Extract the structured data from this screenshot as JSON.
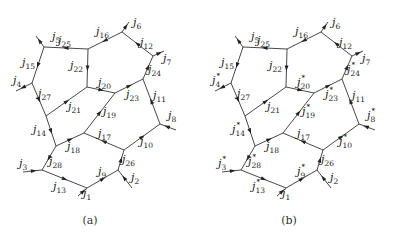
{
  "panels": [
    {
      "id": "a",
      "caption": "(a)",
      "offset_x": 0,
      "labels": [
        {
          "name": "j",
          "sub": "5",
          "star": false,
          "x": 52,
          "y": 40
        },
        {
          "name": "j",
          "sub": "25",
          "star": false,
          "x": 58,
          "y": 44
        },
        {
          "name": "j",
          "sub": "16",
          "star": false,
          "x": 96,
          "y": 35
        },
        {
          "name": "j",
          "sub": "6",
          "star": false,
          "x": 133,
          "y": 26
        },
        {
          "name": "j",
          "sub": "12",
          "star": false,
          "x": 140,
          "y": 46
        },
        {
          "name": "j",
          "sub": "7",
          "star": false,
          "x": 163,
          "y": 62
        },
        {
          "name": "j",
          "sub": "24",
          "star": false,
          "x": 148,
          "y": 73
        },
        {
          "name": "j",
          "sub": "22",
          "star": false,
          "x": 70,
          "y": 69
        },
        {
          "name": "j",
          "sub": "15",
          "star": false,
          "x": 22,
          "y": 66
        },
        {
          "name": "j",
          "sub": "4",
          "star": false,
          "x": 13,
          "y": 84
        },
        {
          "name": "j",
          "sub": "27",
          "star": false,
          "x": 38,
          "y": 97
        },
        {
          "name": "j",
          "sub": "20",
          "star": false,
          "x": 98,
          "y": 86
        },
        {
          "name": "j",
          "sub": "23",
          "star": false,
          "x": 126,
          "y": 98
        },
        {
          "name": "j",
          "sub": "11",
          "star": false,
          "x": 153,
          "y": 99
        },
        {
          "name": "j",
          "sub": "21",
          "star": false,
          "x": 68,
          "y": 110
        },
        {
          "name": "j",
          "sub": "19",
          "star": false,
          "x": 103,
          "y": 115
        },
        {
          "name": "j",
          "sub": "8",
          "star": false,
          "x": 168,
          "y": 119
        },
        {
          "name": "j",
          "sub": "14",
          "star": false,
          "x": 33,
          "y": 133
        },
        {
          "name": "j",
          "sub": "17",
          "star": false,
          "x": 98,
          "y": 137
        },
        {
          "name": "j",
          "sub": "10",
          "star": false,
          "x": 140,
          "y": 145
        },
        {
          "name": "j",
          "sub": "18",
          "star": false,
          "x": 67,
          "y": 150
        },
        {
          "name": "j",
          "sub": "28",
          "star": false,
          "x": 49,
          "y": 165
        },
        {
          "name": "j",
          "sub": "26",
          "star": false,
          "x": 122,
          "y": 163
        },
        {
          "name": "j",
          "sub": "3",
          "star": false,
          "x": 19,
          "y": 167
        },
        {
          "name": "j",
          "sub": "9",
          "star": false,
          "x": 98,
          "y": 175
        },
        {
          "name": "j",
          "sub": "13",
          "star": false,
          "x": 53,
          "y": 190
        },
        {
          "name": "j",
          "sub": "2",
          "star": false,
          "x": 131,
          "y": 181
        },
        {
          "name": "j",
          "sub": "1",
          "star": false,
          "x": 83,
          "y": 197
        }
      ]
    },
    {
      "id": "b",
      "caption": "(b)",
      "offset_x": 199,
      "labels": [
        {
          "name": "j",
          "sub": "5",
          "star": false,
          "x": 52,
          "y": 40
        },
        {
          "name": "j",
          "sub": "25",
          "star": false,
          "x": 58,
          "y": 44
        },
        {
          "name": "j",
          "sub": "16",
          "star": false,
          "x": 96,
          "y": 35
        },
        {
          "name": "j",
          "sub": "6",
          "star": false,
          "x": 133,
          "y": 26
        },
        {
          "name": "j",
          "sub": "12",
          "star": false,
          "x": 140,
          "y": 46
        },
        {
          "name": "j",
          "sub": "7",
          "star": false,
          "x": 163,
          "y": 62
        },
        {
          "name": "j",
          "sub": "24",
          "star": true,
          "x": 148,
          "y": 73
        },
        {
          "name": "j",
          "sub": "22",
          "star": false,
          "x": 70,
          "y": 69
        },
        {
          "name": "j",
          "sub": "15",
          "star": false,
          "x": 22,
          "y": 66
        },
        {
          "name": "j",
          "sub": "4",
          "star": true,
          "x": 13,
          "y": 84
        },
        {
          "name": "j",
          "sub": "27",
          "star": false,
          "x": 38,
          "y": 97
        },
        {
          "name": "j",
          "sub": "20",
          "star": true,
          "x": 98,
          "y": 86
        },
        {
          "name": "j",
          "sub": "23",
          "star": true,
          "x": 126,
          "y": 98
        },
        {
          "name": "j",
          "sub": "11",
          "star": false,
          "x": 153,
          "y": 99
        },
        {
          "name": "j",
          "sub": "21",
          "star": false,
          "x": 68,
          "y": 110
        },
        {
          "name": "j",
          "sub": "19",
          "star": true,
          "x": 103,
          "y": 115
        },
        {
          "name": "j",
          "sub": "8",
          "star": true,
          "x": 168,
          "y": 119
        },
        {
          "name": "j",
          "sub": "14",
          "star": true,
          "x": 33,
          "y": 133
        },
        {
          "name": "j",
          "sub": "17",
          "star": false,
          "x": 98,
          "y": 137
        },
        {
          "name": "j",
          "sub": "10",
          "star": true,
          "x": 140,
          "y": 145
        },
        {
          "name": "j",
          "sub": "18",
          "star": false,
          "x": 67,
          "y": 150
        },
        {
          "name": "j",
          "sub": "28",
          "star": true,
          "x": 49,
          "y": 165
        },
        {
          "name": "j",
          "sub": "26",
          "star": false,
          "x": 122,
          "y": 163
        },
        {
          "name": "j",
          "sub": "3",
          "star": true,
          "x": 19,
          "y": 167
        },
        {
          "name": "j",
          "sub": "9",
          "star": true,
          "x": 98,
          "y": 175
        },
        {
          "name": "j",
          "sub": "13",
          "star": true,
          "x": 53,
          "y": 190
        },
        {
          "name": "j",
          "sub": "2",
          "star": false,
          "x": 131,
          "y": 181
        },
        {
          "name": "j",
          "sub": "1",
          "star": false,
          "x": 83,
          "y": 197
        }
      ]
    }
  ],
  "graph": {
    "nodes": {
      "A": [
        44,
        47
      ],
      "B": [
        88,
        49
      ],
      "C": [
        122,
        32
      ],
      "D": [
        153,
        56
      ],
      "E": [
        143,
        79
      ],
      "F": [
        115,
        93
      ],
      "G": [
        87,
        87
      ],
      "H": [
        32,
        83
      ],
      "I": [
        46,
        116
      ],
      "J": [
        56,
        146
      ],
      "K": [
        84,
        133
      ],
      "L": [
        124,
        150
      ],
      "M": [
        160,
        124
      ],
      "N": [
        42,
        170
      ],
      "O": [
        87,
        188
      ],
      "P": [
        118,
        170
      ]
    },
    "edges": [
      {
        "from": "B",
        "to": "A",
        "label": "j25"
      },
      {
        "from": "A",
        "to": "H",
        "label": "j15",
        "rev": true
      },
      {
        "from": "H",
        "to": "I",
        "label": "j27",
        "rev": true
      },
      {
        "from": "I",
        "to": "J",
        "label": "j14",
        "rev": true
      },
      {
        "from": "J",
        "to": "N",
        "label": "j28",
        "rev": true
      },
      {
        "from": "N",
        "to": "O",
        "label": "j13",
        "rev": true
      },
      {
        "from": "O",
        "to": "P",
        "label": "j9"
      },
      {
        "from": "P",
        "to": "L",
        "label": "j26"
      },
      {
        "from": "L",
        "to": "M",
        "label": "j10"
      },
      {
        "from": "M",
        "to": "E",
        "label": "j11",
        "rev": true
      },
      {
        "from": "E",
        "to": "D",
        "label": "j24"
      },
      {
        "from": "D",
        "to": "C",
        "label": "j12",
        "rev": true
      },
      {
        "from": "C",
        "to": "B",
        "label": "j16",
        "rev": true
      },
      {
        "from": "B",
        "to": "G",
        "label": "j22",
        "rev": true
      },
      {
        "from": "G",
        "to": "F",
        "label": "j20"
      },
      {
        "from": "F",
        "to": "E",
        "label": "j23"
      },
      {
        "from": "I",
        "to": "G",
        "label": "j21"
      },
      {
        "from": "K",
        "to": "F",
        "label": "j19"
      },
      {
        "from": "L",
        "to": "K",
        "label": "j17"
      },
      {
        "from": "J",
        "to": "K",
        "label": "j18"
      }
    ],
    "externals": [
      {
        "node": "A",
        "to": [
          36,
          36
        ],
        "label": "j5",
        "inward": false
      },
      {
        "node": "C",
        "to": [
          129,
          22
        ],
        "label": "j6",
        "inward": false
      },
      {
        "node": "D",
        "to": [
          164,
          51
        ],
        "label": "j7",
        "inward": false
      },
      {
        "node": "H",
        "to": [
          16,
          91
        ],
        "label": "j4",
        "inward": false
      },
      {
        "node": "M",
        "to": [
          176,
          130
        ],
        "label": "j8",
        "inward": true
      },
      {
        "node": "N",
        "to": [
          23,
          172
        ],
        "label": "j3",
        "inward": true
      },
      {
        "node": "O",
        "to": [
          78,
          196
        ],
        "label": "j1",
        "inward": true
      },
      {
        "node": "P",
        "to": [
          132,
          188
        ],
        "label": "j2",
        "inward": true
      }
    ]
  }
}
